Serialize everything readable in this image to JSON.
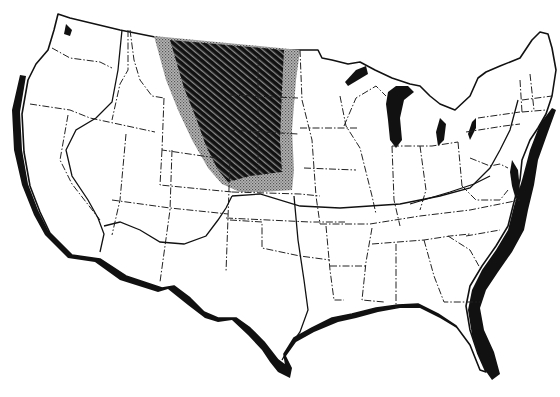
{
  "map": {
    "subject": "Contiguous United States",
    "style": "black-and-white outline map",
    "colors": {
      "background": "#ffffff",
      "outline": "#111111",
      "core_region": "#1a1a1a",
      "fringe_region": "#9a9a9a"
    },
    "layers": [
      {
        "id": "coastline",
        "description": "Heavy black shadowed coastline along Pacific, Gulf, and Atlantic coasts"
      },
      {
        "id": "state-boundaries",
        "description": "Dash-dot state boundary lines"
      },
      {
        "id": "great-lakes",
        "description": "Great Lakes filled black"
      },
      {
        "id": "zone-boundaries",
        "description": "Solid lines dividing the country into regions (western arc through Nevada/Oregon, southern loop through California/Arizona/New Mexico, east-west line across central states, north-south line through Texas/Oklahoma)"
      },
      {
        "id": "core-region",
        "description": "Dark diagonally hatched area over northern Great Plains (Montana east, Dakotas, Wyoming, Nebraska)"
      },
      {
        "id": "fringe-region",
        "description": "Lighter stippled band surrounding the core region on west, south, and east sides"
      }
    ],
    "labels": []
  }
}
